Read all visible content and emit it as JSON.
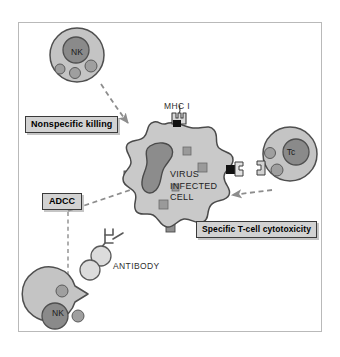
{
  "figure": {
    "domain": "immunology-diagram"
  },
  "labels": {
    "nonspecific_killing": "Nonspecific killing",
    "adcc": "ADCC",
    "specific_cytotoxicity": "Specific T-cell cytotoxicity",
    "mhc": "MHC I",
    "antibody": "ANTIBODY"
  },
  "target_cell": {
    "name_lines": [
      "VIRUS",
      "INFECTED",
      "CELL"
    ],
    "fill": "#c9c9c9",
    "stroke": "#4a4a4a",
    "nucleus_fill": "#8c8c8c",
    "antigen_fill": "#9a9a9a",
    "antigen_count": 4,
    "membrane_receptor_count": 3
  },
  "effector_cells": [
    {
      "id": "nk-top",
      "tag": "NK",
      "role": "natural-killer-cell",
      "mechanism": "nonspecific_killing",
      "body_fill": "#c4c4c4",
      "nucleus_fill": "#8a8a8a",
      "granule_count": 3
    },
    {
      "id": "nk-bottom",
      "tag": "NK",
      "role": "natural-killer-cell",
      "mechanism": "adcc",
      "body_fill": "#c4c4c4",
      "nucleus_fill": "#8a8a8a",
      "granule_count": 2,
      "has_fc_notch": true
    },
    {
      "id": "tc",
      "tag": "Tc",
      "role": "cytotoxic-t-cell",
      "mechanism": "specific_cytotoxicity",
      "body_fill": "#c4c4c4",
      "nucleus_fill": "#8a8a8a",
      "granule_count": 2,
      "has_tcr": true
    }
  ],
  "antibody": {
    "shape": "Y",
    "fc_receptor_circles": 2,
    "circle_fill": "#dcdcdc",
    "stroke": "#555555"
  },
  "arrows": [
    {
      "id": "arrow-nk-top",
      "from": "nk-top",
      "to": "target_cell",
      "style": "dashed",
      "color": "#8d8d8d"
    },
    {
      "id": "arrow-adcc",
      "from": "nk-bottom",
      "to": "target_cell",
      "style": "dashed",
      "color": "#8d8d8d"
    },
    {
      "id": "arrow-antibody",
      "from": "antibody",
      "to": "nk-bottom",
      "style": "dashed",
      "color": "#8d8d8d"
    },
    {
      "id": "arrow-tc",
      "from": "tc",
      "to": "target_cell",
      "style": "dashed",
      "color": "#8d8d8d"
    }
  ],
  "frame": {
    "border_color": "#b9b9b9",
    "background": "#ffffff"
  }
}
